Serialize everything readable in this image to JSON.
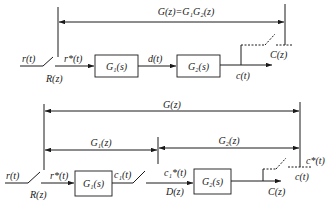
{
  "diagram": {
    "type": "sampled-data block diagram",
    "colors": {
      "stroke": "#1a1a1a",
      "background": "#ffffff"
    },
    "top": {
      "span_label": "G(z)=G₁G₂(z)",
      "input_label": "r(t)",
      "sampler_label": "R(z)",
      "sampled_signal": "r*(t)",
      "block1": "G₁(s)",
      "mid_signal": "d(t)",
      "block2": "G₂(s)",
      "output_signal": "c(t)",
      "output_sampler_label": "C(z)"
    },
    "bottom": {
      "span_label": "G(z)",
      "span1_label": "G₁(z)",
      "span2_label": "G₂(z)",
      "input_label": "r(t)",
      "sampler_label": "R(z)",
      "sampled_signal": "r*(t)",
      "block1": "G₁(s)",
      "block1_output": "c₁(t)",
      "sampled_mid": "c₁*(t)",
      "mid_sampler_label": "D(z)",
      "block2": "G₂(s)",
      "output_label": "C(z)",
      "sampled_output": "c*(t)",
      "output_signal": "c(t)"
    }
  }
}
